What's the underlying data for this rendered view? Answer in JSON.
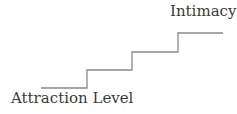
{
  "diagram": {
    "top_label": "Intimacy",
    "bottom_label": "Attraction Level",
    "steps": [
      {
        "x1": 41,
        "x2": 87,
        "y": 88
      },
      {
        "x1": 87,
        "x2": 132,
        "y": 70
      },
      {
        "x1": 132,
        "x2": 178,
        "y": 52
      },
      {
        "x1": 178,
        "x2": 223,
        "y": 33
      }
    ],
    "line_color": "#8a8a8a"
  }
}
